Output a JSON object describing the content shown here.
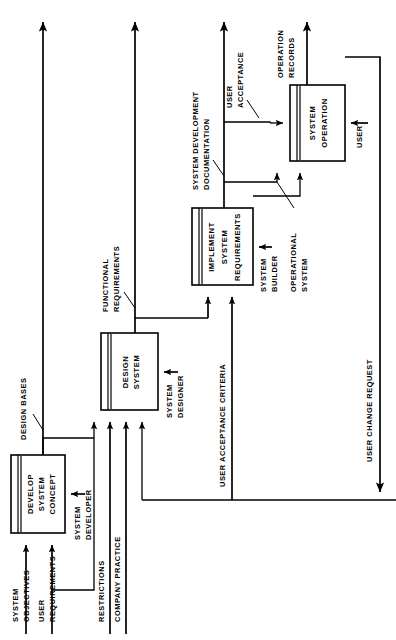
{
  "diagram": {
    "orientation": "rotated-90-ccw",
    "stroke_color": "#000000",
    "background_color": "#ffffff",
    "activities": [
      {
        "id": "develop",
        "label_lines": [
          "DEVELOP",
          "SYSTEM",
          "CONCEPT"
        ],
        "mechanism": [
          "SYSTEM",
          "DEVELOPER"
        ]
      },
      {
        "id": "design",
        "label_lines": [
          "DESIGN",
          "SYSTEM"
        ],
        "mechanism": [
          "SYSTEM",
          "DESIGNER"
        ]
      },
      {
        "id": "implement",
        "label_lines": [
          "IMPLEMENT",
          "SYSTEM",
          "REQUIREMENTS"
        ],
        "mechanism": [
          "SYSTEM",
          "BUILDER"
        ]
      },
      {
        "id": "operation",
        "label_lines": [
          "SYSTEM",
          "OPERATION"
        ],
        "mechanism": [
          "USER"
        ]
      }
    ],
    "flows": [
      {
        "id": "system-objectives",
        "lines": [
          "SYSTEM",
          "OBJECTIVES"
        ]
      },
      {
        "id": "user-requirements",
        "lines": [
          "USER",
          "REQUIREMENTS"
        ]
      },
      {
        "id": "restrictions",
        "lines": [
          "RESTRICTIONS"
        ]
      },
      {
        "id": "company-practice",
        "lines": [
          "COMPANY PRACTICE"
        ]
      },
      {
        "id": "design-bases",
        "lines": [
          "DESIGN BASES"
        ]
      },
      {
        "id": "functional-requirements",
        "lines": [
          "FUNCTIONAL",
          "REQUIREMENTS"
        ]
      },
      {
        "id": "user-acceptance-criteria",
        "lines": [
          "USER ACCEPTANCE CRITERIA"
        ]
      },
      {
        "id": "system-development-documentation",
        "lines": [
          "SYSTEM DEVELOPMENT",
          "DOCUMENTATION"
        ]
      },
      {
        "id": "user-acceptance",
        "lines": [
          "USER",
          "ACCEPTANCE"
        ]
      },
      {
        "id": "operational-system",
        "lines": [
          "OPERATIONAL",
          "SYSTEM"
        ]
      },
      {
        "id": "operation-records",
        "lines": [
          "OPERATION",
          "RECORDS"
        ]
      },
      {
        "id": "user-change-request",
        "lines": [
          "USER CHANGE REQUEST"
        ]
      }
    ],
    "mechanism_labels": [
      {
        "id": "system-developer",
        "lines": [
          "SYSTEM",
          "DEVELOPER"
        ]
      },
      {
        "id": "system-designer",
        "lines": [
          "SYSTEM",
          "DESIGNER"
        ]
      },
      {
        "id": "system-builder",
        "lines": [
          "SYSTEM",
          "BUILDER"
        ]
      },
      {
        "id": "user",
        "lines": [
          "USER"
        ]
      }
    ]
  }
}
